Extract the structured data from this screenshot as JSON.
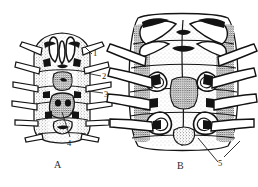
{
  "plate": {
    "background_color": "#ffffff",
    "ink_color": "#1a1a1a",
    "width": 258,
    "height": 187
  },
  "figures": [
    {
      "id": "figure-a",
      "caption": "A",
      "description": "ventral habitus line drawing of segmented arthropod"
    },
    {
      "id": "figure-b",
      "caption": "B",
      "description": "enlarged ventral detail of body segments and leg bases"
    }
  ],
  "leader_labels": [
    {
      "id": "label-1",
      "text": "1",
      "figure": "A"
    },
    {
      "id": "label-2",
      "text": "2",
      "figure": "A"
    },
    {
      "id": "label-3",
      "text": "3",
      "figure": "A"
    },
    {
      "id": "label-4",
      "text": "4",
      "figure": "A"
    },
    {
      "id": "label-5",
      "text": "5",
      "figure": "B"
    }
  ],
  "captions": {
    "a": "A",
    "b": "B"
  },
  "callouts": {
    "one": "1",
    "two": "2",
    "three": "3",
    "four": "4",
    "five": "5"
  }
}
